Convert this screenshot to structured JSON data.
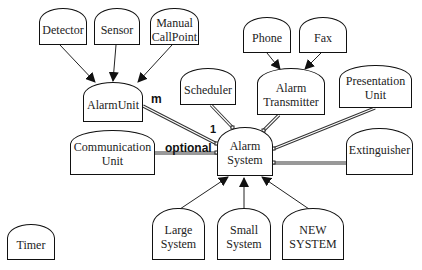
{
  "diagram": {
    "type": "class-dependency-diagram",
    "nodes": {
      "detector": "Detector",
      "sensor": "Sensor",
      "manual_callpoint": "Manual\nCallPoint",
      "alarm_unit": "AlarmUnit",
      "scheduler": "Scheduler",
      "phone": "Phone",
      "fax": "Fax",
      "alarm_transmitter": "Alarm\nTransmitter",
      "presentation_unit": "Presentation\nUnit",
      "communication_unit": "Communication\nUnit",
      "alarm_system": "Alarm\nSystem",
      "extinguisher": "Extinguisher",
      "large_system": "Large\nSystem",
      "small_system": "Small\nSystem",
      "new_system": "NEW\nSYSTEM",
      "timer": "Timer"
    },
    "labels": {
      "multiplicity_m": "m",
      "multiplicity_1": "1",
      "optional": "optional"
    },
    "edges": [
      {
        "from": "Detector",
        "to": "AlarmUnit",
        "kind": "inheritance-arrow"
      },
      {
        "from": "Sensor",
        "to": "AlarmUnit",
        "kind": "inheritance-arrow"
      },
      {
        "from": "Manual CallPoint",
        "to": "AlarmUnit",
        "kind": "inheritance-arrow"
      },
      {
        "from": "Phone",
        "to": "Alarm Transmitter",
        "kind": "inheritance-arrow"
      },
      {
        "from": "Fax",
        "to": "Alarm Transmitter",
        "kind": "inheritance-arrow"
      },
      {
        "from": "Large System",
        "to": "Alarm System",
        "kind": "inheritance-arrow"
      },
      {
        "from": "Small System",
        "to": "Alarm System",
        "kind": "inheritance-arrow"
      },
      {
        "from": "NEW SYSTEM",
        "to": "Alarm System",
        "kind": "inheritance-arrow"
      },
      {
        "from": "AlarmUnit",
        "to": "Alarm System",
        "kind": "aggregation",
        "label_from": "m",
        "label_to": "1"
      },
      {
        "from": "Scheduler",
        "to": "Alarm System",
        "kind": "aggregation"
      },
      {
        "from": "Alarm Transmitter",
        "to": "Alarm System",
        "kind": "aggregation"
      },
      {
        "from": "Presentation Unit",
        "to": "Alarm System",
        "kind": "aggregation"
      },
      {
        "from": "Communication Unit",
        "to": "Alarm System",
        "kind": "aggregation",
        "label": "optional"
      },
      {
        "from": "Extinguisher",
        "to": "Alarm System",
        "kind": "aggregation"
      }
    ]
  }
}
